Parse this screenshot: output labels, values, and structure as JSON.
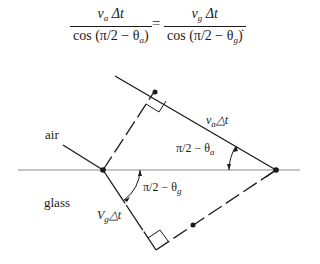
{
  "equation": {
    "lhs_numerator": "v",
    "lhs_numerator_sub": "a",
    "lhs_numerator_rest": " Δt",
    "lhs_denominator": "cos (π/2 − θ",
    "lhs_denominator_sub": "a",
    "lhs_denominator_close": ")",
    "equals": "=",
    "rhs_numerator": "v",
    "rhs_numerator_sub": "g",
    "rhs_numerator_rest": " Δt",
    "rhs_denominator": "cos (π/2 − θ",
    "rhs_denominator_sub": "g",
    "rhs_denominator_close": ")",
    "terminator": "."
  },
  "labels": {
    "air": "air",
    "glass": "glass",
    "va_dt": {
      "v": "v",
      "sub": "a",
      "rest": "△t"
    },
    "vg_dt": {
      "v": "V",
      "sub": "g",
      "rest": "△t"
    },
    "angle_a": {
      "text": "π/2 − θ",
      "sub": "a"
    },
    "angle_g": {
      "text": "π/2 − θ",
      "sub": "g"
    }
  },
  "colors": {
    "ink": "#1a1a1a",
    "interface_line": "#8a8a8a",
    "background": "#ffffff"
  }
}
